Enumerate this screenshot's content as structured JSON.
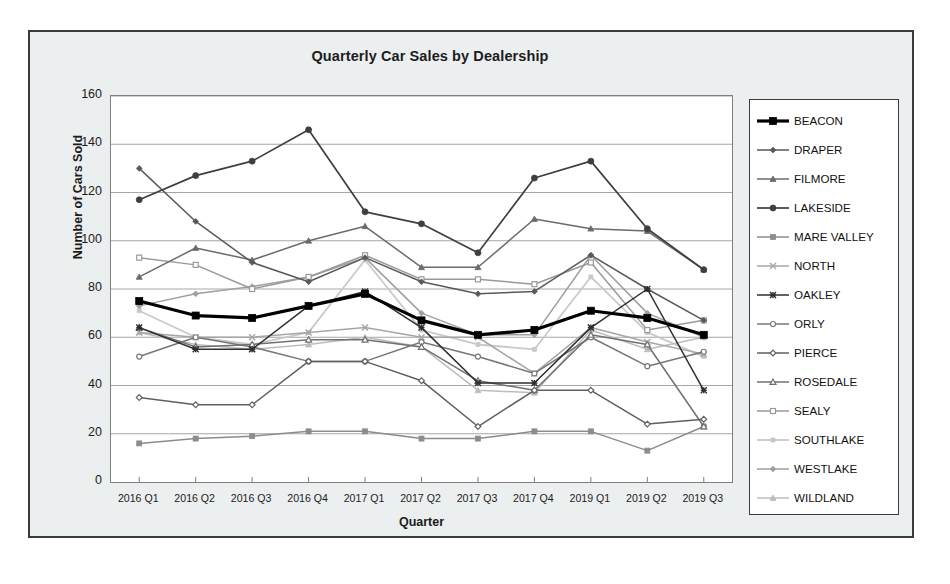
{
  "chart_data": {
    "type": "line",
    "title": "Quarterly Car Sales by Dealership",
    "xlabel": "Quarter",
    "ylabel": "Number of Cars Sold",
    "ylim": [
      0,
      160
    ],
    "ytick_step": 20,
    "yticks": [
      0,
      20,
      40,
      60,
      80,
      100,
      120,
      140,
      160
    ],
    "grid": "horizontal",
    "legend_position": "right",
    "categories": [
      "2016 Q1",
      "2016 Q2",
      "2016 Q3",
      "2016 Q4",
      "2017 Q1",
      "2017 Q2",
      "2017 Q3",
      "2017 Q4",
      "2019 Q1",
      "2019 Q2",
      "2019 Q3"
    ],
    "series": [
      {
        "name": "BEACON",
        "marker": "square",
        "color": "#000000",
        "width": 3.2,
        "markersize": 7,
        "filled": true,
        "values": [
          75,
          69,
          68,
          73,
          78,
          67,
          61,
          63,
          71,
          68,
          61
        ]
      },
      {
        "name": "DRAPER",
        "marker": "diamond",
        "color": "#595959",
        "width": 1.5,
        "markersize": 5,
        "filled": true,
        "values": [
          130,
          108,
          91,
          83,
          93,
          83,
          78,
          79,
          94,
          80,
          67
        ]
      },
      {
        "name": "FILMORE",
        "marker": "triangle",
        "color": "#6b6b6b",
        "width": 1.5,
        "markersize": 5,
        "filled": true,
        "values": [
          85,
          97,
          92,
          100,
          106,
          89,
          89,
          109,
          105,
          104,
          88
        ]
      },
      {
        "name": "LAKESIDE",
        "marker": "circle",
        "color": "#3f3f3f",
        "width": 1.7,
        "markersize": 6,
        "filled": true,
        "values": [
          117,
          127,
          133,
          146,
          112,
          107,
          95,
          126,
          133,
          105,
          88
        ]
      },
      {
        "name": "MARE VALLEY",
        "marker": "square",
        "color": "#8c8c8c",
        "width": 1.5,
        "markersize": 5,
        "filled": true,
        "values": [
          16,
          18,
          19,
          21,
          21,
          18,
          18,
          21,
          21,
          13,
          23
        ]
      },
      {
        "name": "NORTH",
        "marker": "cross",
        "color": "#a6a6a6",
        "width": 1.5,
        "markersize": 6,
        "filled": false,
        "values": [
          62,
          60,
          60,
          62,
          64,
          60,
          60,
          45,
          64,
          58,
          53
        ]
      },
      {
        "name": "OAKLEY",
        "marker": "star",
        "color": "#2e2e2e",
        "width": 1.5,
        "markersize": 6,
        "filled": true,
        "values": [
          64,
          55,
          55,
          73,
          79,
          64,
          41,
          41,
          64,
          80,
          38
        ]
      },
      {
        "name": "ORLY",
        "marker": "circle-open",
        "color": "#777777",
        "width": 1.5,
        "markersize": 5,
        "filled": false,
        "values": [
          52,
          60,
          56,
          50,
          50,
          58,
          52,
          45,
          60,
          48,
          54
        ]
      },
      {
        "name": "PIERCE",
        "marker": "diamond-open",
        "color": "#5f5f5f",
        "width": 1.5,
        "markersize": 5,
        "filled": false,
        "values": [
          35,
          32,
          32,
          50,
          50,
          42,
          23,
          38,
          38,
          24,
          26
        ]
      },
      {
        "name": "ROSEDALE",
        "marker": "triangle-open",
        "color": "#707070",
        "width": 1.5,
        "markersize": 5,
        "filled": false,
        "values": [
          64,
          56,
          57,
          59,
          59,
          56,
          42,
          38,
          61,
          57,
          23
        ]
      },
      {
        "name": "SEALY",
        "marker": "square-open",
        "color": "#9a9a9a",
        "width": 1.5,
        "markersize": 5,
        "filled": false,
        "values": [
          93,
          90,
          80,
          85,
          94,
          84,
          84,
          82,
          91,
          63,
          67
        ]
      },
      {
        "name": "SOUTHLAKE",
        "marker": "square-small",
        "color": "#c9c9c9",
        "width": 1.8,
        "markersize": 4,
        "filled": true,
        "values": [
          71,
          60,
          57,
          62,
          92,
          63,
          57,
          55,
          85,
          62,
          52
        ]
      },
      {
        "name": "WESTLAKE",
        "marker": "diamond",
        "color": "#9f9f9f",
        "width": 1.5,
        "markersize": 5,
        "filled": true,
        "values": [
          73,
          78,
          81,
          85,
          93,
          70,
          61,
          61,
          94,
          70,
          60
        ]
      },
      {
        "name": "WILDLAND",
        "marker": "triangle-small",
        "color": "#bdbdbd",
        "width": 1.5,
        "markersize": 5,
        "filled": true,
        "values": [
          62,
          57,
          55,
          57,
          60,
          56,
          38,
          37,
          63,
          55,
          60
        ]
      }
    ]
  },
  "legend": {
    "items": [
      {
        "label": "BEACON"
      },
      {
        "label": "DRAPER"
      },
      {
        "label": "FILMORE"
      },
      {
        "label": "LAKESIDE"
      },
      {
        "label": "MARE VALLEY"
      },
      {
        "label": "NORTH"
      },
      {
        "label": "OAKLEY"
      },
      {
        "label": "ORLY"
      },
      {
        "label": "PIERCE"
      },
      {
        "label": "ROSEDALE"
      },
      {
        "label": "SEALY"
      },
      {
        "label": "SOUTHLAKE"
      },
      {
        "label": "WESTLAKE"
      },
      {
        "label": "WILDLAND"
      }
    ]
  }
}
